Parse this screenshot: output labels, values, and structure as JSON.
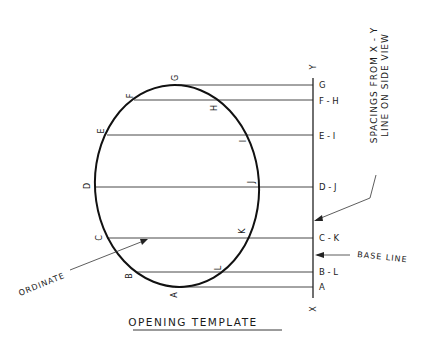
{
  "diagram": {
    "title": "OPENING TEMPLATE",
    "axis": {
      "top_label": "Y",
      "bottom_label": "X"
    },
    "ellipse_points": {
      "left": [
        "G",
        "F",
        "E",
        "D",
        "C",
        "B",
        "A"
      ],
      "right": [
        "H",
        "I",
        "J",
        "K",
        "L"
      ]
    },
    "point_labels": {
      "G": "G",
      "F": "F",
      "E": "E",
      "D": "D",
      "C": "C",
      "B": "B",
      "A": "A",
      "H": "H",
      "I": "I",
      "J": "J",
      "K": "K",
      "L": "L"
    },
    "rows": [
      {
        "label": "G",
        "y": 85
      },
      {
        "label": "F - H",
        "y": 100
      },
      {
        "label": "E - I",
        "y": 135
      },
      {
        "label": "D - J",
        "y": 187
      },
      {
        "label": "C - K",
        "y": 238
      },
      {
        "label": "B - L",
        "y": 272
      },
      {
        "label": "A",
        "y": 287
      }
    ],
    "annotations": {
      "spacings_line1": "SPACINGS FROM X - Y",
      "spacings_line2": "LINE ON SIDE VIEW",
      "base_line": "BASE LINE",
      "ordinate": "ORDINATE"
    },
    "colors": {
      "ink": "#1a1a1a",
      "background": "#ffffff"
    }
  }
}
